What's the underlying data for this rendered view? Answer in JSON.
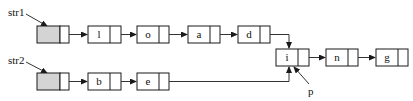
{
  "diagram": {
    "title": "",
    "labels": {
      "str1": "str1",
      "str2": "str2",
      "p": "p"
    },
    "list1": {
      "head_label": "str1",
      "nodes": [
        "l",
        "o",
        "a",
        "d"
      ]
    },
    "list2": {
      "head_label": "str2",
      "nodes": [
        "b",
        "e"
      ]
    },
    "shared": {
      "nodes": [
        "i",
        "n",
        "g"
      ],
      "pointer_label": "p",
      "pointer_target": "i"
    },
    "colors": {
      "head_fill": "#d4d4d4",
      "stroke": "#1a1a1a",
      "background": "#ffffff"
    }
  }
}
